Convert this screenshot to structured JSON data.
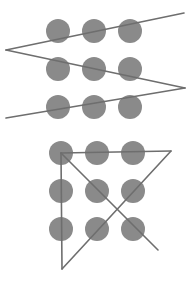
{
  "diagram": {
    "title": "",
    "colors": {
      "dot": "#8a8a8a",
      "line": "#6e6e6e",
      "background": "#ffffff"
    },
    "dot_radius": 12,
    "panels": [
      {
        "name": "zigzag-solution",
        "dots": [
          [
            58,
            31
          ],
          [
            94,
            31
          ],
          [
            130,
            31
          ],
          [
            58,
            69
          ],
          [
            94,
            69
          ],
          [
            130,
            69
          ],
          [
            58,
            107
          ],
          [
            94,
            107
          ],
          [
            130,
            107
          ]
        ],
        "lines": [
          [
            6,
            50,
            184,
            13
          ],
          [
            6,
            50,
            185,
            88
          ],
          [
            185,
            88,
            6,
            118
          ]
        ]
      },
      {
        "name": "triangle-solution",
        "dots": [
          [
            61,
            153
          ],
          [
            97,
            153
          ],
          [
            133,
            153
          ],
          [
            61,
            191
          ],
          [
            97,
            191
          ],
          [
            133,
            191
          ],
          [
            61,
            229
          ],
          [
            97,
            229
          ],
          [
            133,
            229
          ]
        ],
        "lines": [
          [
            61,
            153,
            171,
            151
          ],
          [
            171,
            151,
            62,
            269
          ],
          [
            62,
            269,
            61,
            153
          ],
          [
            61,
            153,
            158,
            250
          ]
        ]
      }
    ]
  }
}
